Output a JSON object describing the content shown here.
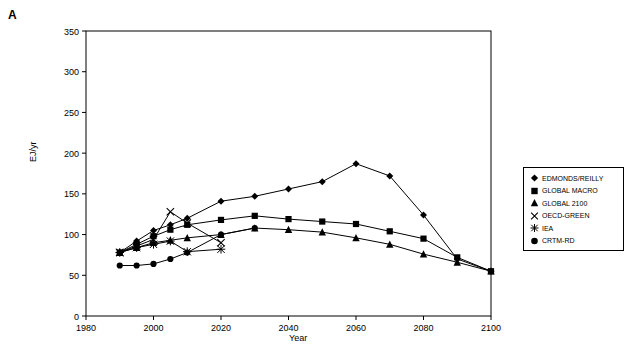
{
  "panel": {
    "label": "A"
  },
  "chart_data": {
    "type": "line",
    "title": "",
    "xlabel": "Year",
    "ylabel": "EJ/yr",
    "xlim": [
      1980,
      2100
    ],
    "ylim": [
      0,
      350
    ],
    "xticks": [
      1980,
      2000,
      2020,
      2040,
      2060,
      2080,
      2100
    ],
    "yticks": [
      0,
      50,
      100,
      150,
      200,
      250,
      300,
      350
    ],
    "grid": false,
    "legend_position": "right-outside",
    "series": [
      {
        "name": "EDMONDS/REILLY",
        "marker": "diamond",
        "x": [
          1990,
          1995,
          2000,
          2005,
          2010,
          2020,
          2030,
          2040,
          2050,
          2060,
          2070,
          2080,
          2090,
          2100
        ],
        "values": [
          78,
          92,
          105,
          112,
          120,
          141,
          147,
          156,
          165,
          187,
          172,
          124,
          70,
          55
        ]
      },
      {
        "name": "GLOBAL MACRO",
        "marker": "square",
        "x": [
          1990,
          1995,
          2000,
          2005,
          2010,
          2020,
          2030,
          2040,
          2050,
          2060,
          2070,
          2080,
          2090,
          2100
        ],
        "values": [
          78,
          88,
          98,
          106,
          112,
          118,
          123,
          119,
          116,
          113,
          104,
          95,
          72,
          55
        ]
      },
      {
        "name": "GLOBAL 2100",
        "marker": "triangle",
        "x": [
          1990,
          1995,
          2000,
          2005,
          2010,
          2020,
          2030,
          2040,
          2050,
          2060,
          2070,
          2080,
          2090,
          2100
        ],
        "values": [
          78,
          84,
          90,
          93,
          96,
          100,
          108,
          106,
          103,
          96,
          88,
          76,
          66,
          55
        ]
      },
      {
        "name": "OECD-GREEN",
        "marker": "cross",
        "x": [
          1990,
          1995,
          2000,
          2005,
          2010,
          2020
        ],
        "values": [
          78,
          86,
          94,
          128,
          114,
          90
        ]
      },
      {
        "name": "IEA",
        "marker": "star",
        "x": [
          1990,
          1995,
          2000,
          2005,
          2010,
          2020
        ],
        "values": [
          78,
          84,
          88,
          92,
          79,
          82
        ]
      },
      {
        "name": "CRTM-RD",
        "marker": "circle",
        "x": [
          1990,
          1995,
          2000,
          2005,
          2010,
          2020,
          2030
        ],
        "values": [
          62,
          62,
          64,
          70,
          78,
          100,
          108
        ]
      }
    ]
  },
  "legend": {
    "items": [
      {
        "label": "EDMONDS/REILLY",
        "marker": "diamond"
      },
      {
        "label": "GLOBAL MACRO",
        "marker": "square"
      },
      {
        "label": "GLOBAL 2100",
        "marker": "triangle"
      },
      {
        "label": "OECD-GREEN",
        "marker": "cross"
      },
      {
        "label": "IEA",
        "marker": "star"
      },
      {
        "label": "CRTM-RD",
        "marker": "circle"
      }
    ]
  }
}
